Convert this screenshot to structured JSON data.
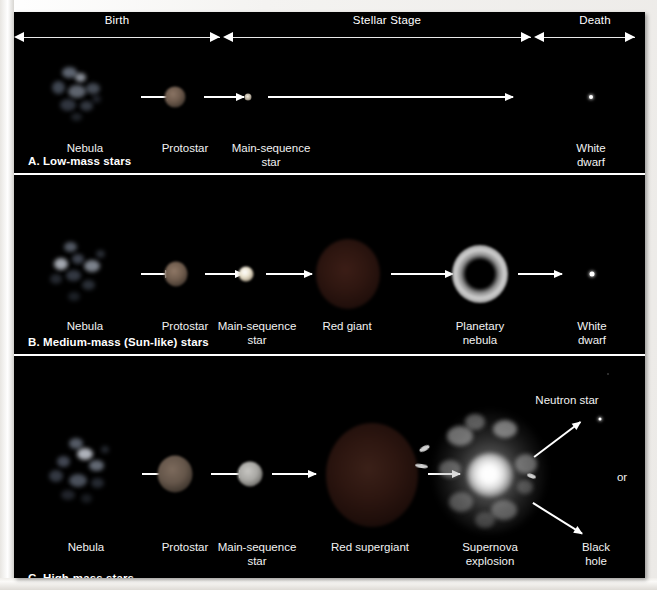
{
  "timeline": {
    "segments": [
      {
        "label": "Birth",
        "name": "birth"
      },
      {
        "label": "Stellar Stage",
        "name": "stellar-stage"
      },
      {
        "label": "Death",
        "name": "death"
      }
    ]
  },
  "panels": [
    {
      "id": "A",
      "caption": "A. Low-mass stars",
      "stages": [
        {
          "name": "nebula",
          "label": "Nebula"
        },
        {
          "name": "protostar",
          "label": "Protostar"
        },
        {
          "name": "main-sequence-star",
          "label": "Main-sequence\nstar"
        },
        {
          "name": "white-dwarf",
          "label": "White dwarf"
        }
      ]
    },
    {
      "id": "B",
      "caption": "B. Medium-mass (Sun-like) stars",
      "stages": [
        {
          "name": "nebula",
          "label": "Nebula"
        },
        {
          "name": "protostar",
          "label": "Protostar"
        },
        {
          "name": "main-sequence-star",
          "label": "Main-sequence\nstar"
        },
        {
          "name": "red-giant",
          "label": "Red giant"
        },
        {
          "name": "planetary-nebula",
          "label": "Planetary\nnebula"
        },
        {
          "name": "white-dwarf",
          "label": "White dwarf"
        }
      ]
    },
    {
      "id": "C",
      "caption": "C. High-mass stars",
      "stages": [
        {
          "name": "nebula",
          "label": "Nebula"
        },
        {
          "name": "protostar",
          "label": "Protostar"
        },
        {
          "name": "main-sequence-star",
          "label": "Main-sequence\nstar"
        },
        {
          "name": "red-supergiant",
          "label": "Red supergiant"
        },
        {
          "name": "supernova",
          "label": "Supernova\nexplosion"
        }
      ],
      "outcomes": [
        {
          "name": "neutron-star",
          "label": "Neutron star"
        },
        {
          "name": "black-hole",
          "label": "Black hole"
        }
      ],
      "connector": "or"
    }
  ],
  "colors": {
    "background": "#000000",
    "frame_border": "#ffffff",
    "text": "#ffffff",
    "arrow": "#ffffff",
    "nebula_glow": "#cfd8e8",
    "protostar": "#6b5a4e",
    "main_sequence": "#e8e2d2",
    "red_giant": "#2a1410",
    "planetary_nebula": "#c9c9c9",
    "supernova_core": "#ffffff"
  }
}
